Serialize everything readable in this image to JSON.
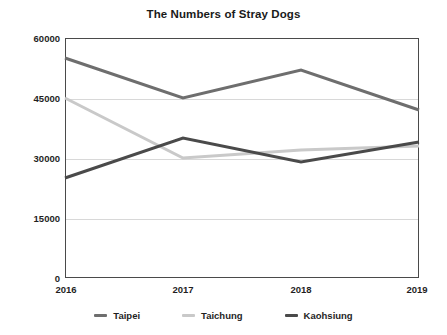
{
  "chart_data": {
    "type": "line",
    "title": "The Numbers of Stray Dogs",
    "xlabel": "",
    "ylabel": "",
    "categories": [
      "2016",
      "2017",
      "2018",
      "2019"
    ],
    "x": [
      2016,
      2017,
      2018,
      2019
    ],
    "ylim": [
      0,
      60000
    ],
    "yticks": [
      0,
      15000,
      30000,
      45000,
      60000
    ],
    "ytick_labels": [
      "0",
      "15000",
      "30000",
      "45000",
      "60000"
    ],
    "grid": true,
    "legend_position": "bottom",
    "series": [
      {
        "name": "Taipei",
        "color": "#6e6e6e",
        "values": [
          55000,
          45000,
          52000,
          42000
        ]
      },
      {
        "name": "Taichung",
        "color": "#c9c9c9",
        "values": [
          45000,
          30000,
          32000,
          33000
        ]
      },
      {
        "name": "Kaohsiung",
        "color": "#4a4a4a",
        "values": [
          25000,
          35000,
          29000,
          34000
        ]
      }
    ]
  },
  "axes": {
    "y_tick_0": "0",
    "y_tick_1": "15000",
    "y_tick_2": "30000",
    "y_tick_3": "45000",
    "y_tick_4": "60000",
    "x_tick_0": "2016",
    "x_tick_1": "2017",
    "x_tick_2": "2018",
    "x_tick_3": "2019"
  },
  "legend": {
    "items": [
      {
        "label": "Taipei",
        "color": "#6e6e6e"
      },
      {
        "label": "Taichung",
        "color": "#c9c9c9"
      },
      {
        "label": "Kaohsiung",
        "color": "#4a4a4a"
      }
    ]
  }
}
